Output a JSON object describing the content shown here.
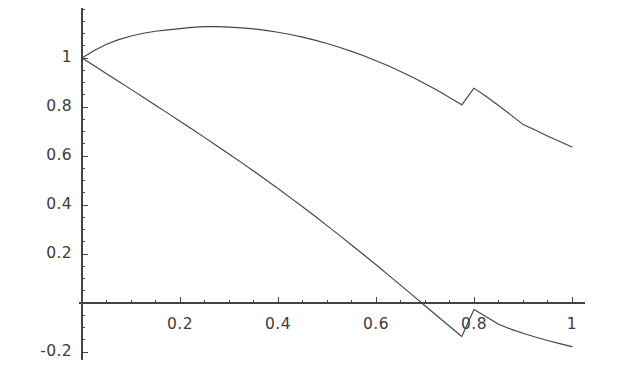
{
  "chart_data": {
    "type": "line",
    "title": "",
    "subtitle": "",
    "xlabel": "",
    "ylabel": "",
    "xlim": [
      0,
      1
    ],
    "ylim": [
      -0.2,
      1.2
    ],
    "grid": false,
    "legend": "none",
    "axis_color": "#444444",
    "line_color": "#444444",
    "background_color": "#ffffff",
    "x_axis_position": 0,
    "y_axis_position": 0,
    "xticks": [
      0.2,
      0.4,
      0.6,
      0.8,
      1
    ],
    "xtick_labels": [
      "0.2",
      "0.4",
      "0.6",
      "0.8",
      "1"
    ],
    "yticks": [
      1,
      0.8,
      0.6,
      0.4,
      0.2,
      -0.2
    ],
    "ytick_labels": [
      "1",
      "0.8",
      "0.6",
      "0.4",
      "0.2",
      "-0.2"
    ],
    "x_minor_tick_step": 0.05,
    "y_minor_tick_step": 0.05,
    "series": [
      {
        "name": "upper-curve",
        "x": [
          0,
          0.025,
          0.05,
          0.075,
          0.1,
          0.125,
          0.15,
          0.175,
          0.2,
          0.225,
          0.25,
          0.275,
          0.3,
          0.325,
          0.35,
          0.375,
          0.4,
          0.425,
          0.45,
          0.475,
          0.5,
          0.525,
          0.55,
          0.575,
          0.6,
          0.625,
          0.65,
          0.675,
          0.7,
          0.725,
          0.75,
          0.775,
          0.8,
          0.825,
          0.85,
          0.875,
          0.9,
          0.925,
          0.95,
          0.975,
          1
        ],
        "values": [
          1.0,
          1.031,
          1.056,
          1.075,
          1.09,
          1.101,
          1.109,
          1.115,
          1.12,
          1.125,
          1.128,
          1.128,
          1.126,
          1.123,
          1.119,
          1.113,
          1.105,
          1.096,
          1.085,
          1.073,
          1.059,
          1.044,
          1.027,
          1.009,
          0.989,
          0.968,
          0.945,
          0.921,
          0.895,
          0.868,
          0.839,
          0.809,
          0.877,
          0.843,
          0.806,
          0.768,
          0.729,
          0.706,
          0.682,
          0.659,
          0.637
        ]
      },
      {
        "name": "lower-curve",
        "x": [
          0,
          0.025,
          0.05,
          0.075,
          0.1,
          0.125,
          0.15,
          0.175,
          0.2,
          0.225,
          0.25,
          0.275,
          0.3,
          0.325,
          0.35,
          0.375,
          0.4,
          0.425,
          0.45,
          0.475,
          0.5,
          0.525,
          0.55,
          0.575,
          0.6,
          0.625,
          0.65,
          0.675,
          0.7,
          0.725,
          0.75,
          0.775,
          0.8,
          0.825,
          0.85,
          0.875,
          0.9,
          0.925,
          0.95,
          0.975,
          1
        ],
        "values": [
          1.0,
          0.968,
          0.936,
          0.904,
          0.872,
          0.84,
          0.807,
          0.775,
          0.742,
          0.709,
          0.676,
          0.642,
          0.608,
          0.574,
          0.539,
          0.503,
          0.467,
          0.43,
          0.393,
          0.355,
          0.316,
          0.277,
          0.237,
          0.197,
          0.156,
          0.115,
          0.073,
          0.031,
          -0.011,
          -0.053,
          -0.095,
          -0.137,
          -0.0265,
          -0.0565,
          -0.0865,
          -0.1065,
          -0.1235,
          -0.139,
          -0.153,
          -0.166,
          -0.178
        ]
      }
    ],
    "annotations": [
      {
        "name": "zero-crossing",
        "series": "lower-curve",
        "x": 0.77,
        "y": 0
      },
      {
        "name": "upper-curve-peak",
        "series": "upper-curve",
        "x": 0.26,
        "y": 1.13
      }
    ]
  },
  "axis": {
    "pixel_origin_x": 82,
    "pixel_origin_y": 303,
    "pixel_per_x_unit": 490,
    "pixel_per_y_unit": 245
  }
}
